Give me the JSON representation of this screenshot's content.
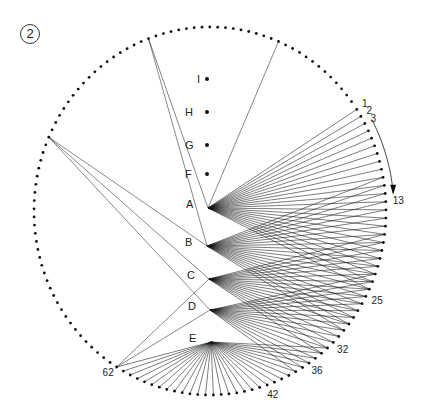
{
  "figure_number": "2",
  "circle": {
    "cx": 210,
    "cy": 211,
    "rx": 176,
    "ry": 184,
    "dot_count": 141,
    "start_angle_deg": -33.5,
    "step_deg": 2.55,
    "dot_color": "#111111"
  },
  "nodes": [
    {
      "id": "I",
      "label": "I",
      "x": 207,
      "y": 79,
      "has_dot": true
    },
    {
      "id": "H",
      "label": "H",
      "x": 207,
      "y": 112,
      "has_dot": true
    },
    {
      "id": "G",
      "label": "G",
      "x": 207,
      "y": 145,
      "has_dot": true
    },
    {
      "id": "F",
      "label": "F",
      "x": 207,
      "y": 174,
      "has_dot": true
    },
    {
      "id": "A",
      "label": "A",
      "x": 208,
      "y": 208,
      "has_dot": false
    },
    {
      "id": "B",
      "label": "B",
      "x": 207,
      "y": 246,
      "has_dot": false
    },
    {
      "id": "C",
      "label": "C",
      "x": 209,
      "y": 279,
      "has_dot": false
    },
    {
      "id": "D",
      "label": "D",
      "x": 210,
      "y": 310,
      "has_dot": false
    },
    {
      "id": "E",
      "label": "E",
      "x": 211,
      "y": 342,
      "has_dot": false
    }
  ],
  "fans": [
    {
      "from": "A",
      "to_range": [
        1,
        24
      ],
      "left_targets": [
        129,
        112
      ]
    },
    {
      "from": "B",
      "to_range": [
        10,
        30
      ],
      "left_targets": [
        112,
        94
      ]
    },
    {
      "from": "C",
      "to_range": [
        17,
        34
      ],
      "left_targets": [
        94,
        62
      ]
    },
    {
      "from": "D",
      "to_range": [
        22,
        38
      ],
      "left_targets": [
        94,
        62
      ]
    },
    {
      "from": "E",
      "to_range": [
        33,
        62
      ],
      "left_targets": []
    }
  ],
  "point_labels": [
    {
      "text": "1",
      "index": 1
    },
    {
      "text": "2",
      "index": 2
    },
    {
      "text": "3",
      "index": 3
    },
    {
      "text": "13",
      "index": 13
    },
    {
      "text": "25",
      "index": 25
    },
    {
      "text": "32",
      "index": 32
    },
    {
      "text": "36",
      "index": 36
    },
    {
      "text": "42",
      "index": 42
    },
    {
      "text": "62",
      "index": 62
    }
  ],
  "arrow": {
    "from_index": 3,
    "to_index": 12,
    "label": "direction of numbering"
  }
}
